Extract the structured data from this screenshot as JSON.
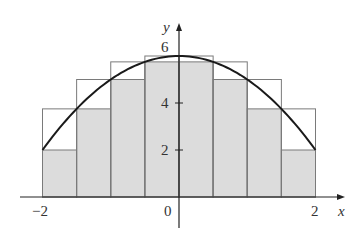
{
  "chart_data": {
    "type": "bar",
    "title": "",
    "subtitle": "Upper and lower Riemann sums for y = 6 - x^2 on [-2, 2], n = 8",
    "xlabel": "x",
    "ylabel": "y",
    "xlim": [
      -2,
      2
    ],
    "ylim": [
      0,
      6
    ],
    "grid": false,
    "legend": null,
    "x_tick_labels": [
      "-2",
      "0",
      "2"
    ],
    "y_tick_labels": [
      "2",
      "4",
      "6"
    ],
    "x_ticks": [
      -2,
      0,
      2
    ],
    "y_ticks": [
      2,
      4,
      6
    ],
    "curve": {
      "name": "f(x) = 6 - x^2",
      "x_range": [
        -2,
        2
      ]
    },
    "categories": [
      "[-2,-1.5]",
      "[-1.5,-1]",
      "[-1,-0.5]",
      "[-0.5,0]",
      "[0,0.5]",
      "[0.5,1]",
      "[1,1.5]",
      "[1.5,2]"
    ],
    "bin_edges": [
      -2,
      -1.5,
      -1,
      -0.5,
      0,
      0.5,
      1,
      1.5,
      2
    ],
    "series": [
      {
        "name": "upper sum (outlined)",
        "values": [
          3.75,
          5,
          5.75,
          6,
          6,
          5.75,
          5,
          3.75
        ]
      },
      {
        "name": "lower sum (shaded)",
        "values": [
          2,
          3.75,
          5,
          5.75,
          5.75,
          5,
          3.75,
          2
        ]
      }
    ],
    "colors": {
      "fill": "#dcdcdc",
      "outline": "#7a7a7a",
      "curve": "#1a1a1a",
      "axis": "#222222"
    }
  },
  "labels": {
    "x_axis": "x",
    "y_axis": "y",
    "x_neg2": "−2",
    "x_zero": "0",
    "x_pos2": "2",
    "y_two": "2",
    "y_four": "4",
    "y_six": "6"
  }
}
